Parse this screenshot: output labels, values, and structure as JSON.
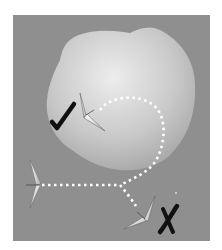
{
  "figure": {
    "panel_color": "#8f8f8f",
    "blob_color_light": "#e8e8e8",
    "blob_color_dark": "#a8a8a8",
    "path_color": "#ffffff",
    "marks": [
      {
        "type": "check",
        "label": "✓",
        "meaning": "correct path"
      },
      {
        "type": "cross",
        "label": "✗",
        "meaning": "incorrect path"
      }
    ],
    "gliders": [
      {
        "name": "glider-start",
        "position": "left"
      },
      {
        "name": "glider-inside-blob",
        "position": "upper-middle"
      },
      {
        "name": "glider-exit",
        "position": "lower-right"
      }
    ]
  }
}
